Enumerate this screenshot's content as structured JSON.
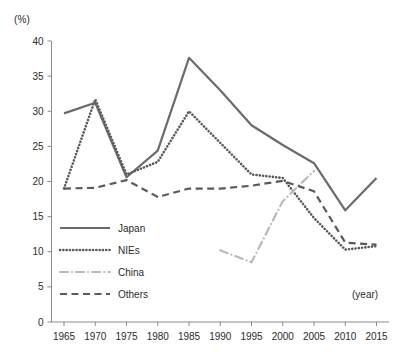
{
  "chart_data": {
    "type": "line",
    "title": "",
    "xlabel": "(year)",
    "ylabel": "(%)",
    "x": [
      1965,
      1970,
      1975,
      1980,
      1985,
      1990,
      1995,
      2000,
      2005,
      2010,
      2015
    ],
    "categories": [
      "1965",
      "1970",
      "1975",
      "1980",
      "1985",
      "1990",
      "1995",
      "2000",
      "2005",
      "2010",
      "2015"
    ],
    "xlim": [
      1963,
      2017
    ],
    "ylim": [
      0,
      40
    ],
    "yticks": [
      0,
      5,
      10,
      15,
      20,
      25,
      30,
      35,
      40
    ],
    "ytick_labels": [
      "0",
      "5",
      "10",
      "15",
      "20",
      "25",
      "30",
      "35",
      "40"
    ],
    "grid": false,
    "legend_position": "lower-left-inside",
    "series": [
      {
        "name": "Japan",
        "style": "solid",
        "color": "#6b6b6b",
        "x": [
          1965,
          1970,
          1975,
          1980,
          1985,
          1990,
          1995,
          2000,
          2005,
          2010,
          2015
        ],
        "values": [
          29.7,
          31.2,
          20.6,
          24.4,
          37.6,
          33.0,
          28.0,
          25.2,
          22.6,
          15.9,
          20.5
        ]
      },
      {
        "name": "NIEs",
        "style": "dotted",
        "color": "#5a5a5a",
        "x": [
          1965,
          1970,
          1975,
          1980,
          1985,
          1990,
          1995,
          2000,
          2005,
          2010,
          2015
        ],
        "values": [
          19.0,
          31.7,
          21.0,
          22.8,
          30.0,
          25.5,
          21.0,
          20.5,
          14.8,
          10.3,
          10.8
        ]
      },
      {
        "name": "China",
        "style": "dashdot",
        "color": "#b9b9b9",
        "x": [
          1990,
          1995,
          2000,
          2005
        ],
        "values": [
          10.2,
          8.5,
          17.2,
          21.5
        ]
      },
      {
        "name": "Others",
        "style": "dashed",
        "color": "#5a5a5a",
        "x": [
          1965,
          1970,
          1975,
          1980,
          1985,
          1990,
          1995,
          2000,
          2005,
          2010,
          2015
        ],
        "values": [
          19.0,
          19.1,
          20.2,
          17.8,
          19.0,
          19.0,
          19.4,
          20.1,
          18.6,
          11.3,
          11.0
        ]
      }
    ]
  },
  "axes": {
    "unit_label": "(%)",
    "x_caption": "(year)"
  },
  "legend": {
    "items": [
      {
        "label": "Japan",
        "style": "solid",
        "color": "#6b6b6b"
      },
      {
        "label": "NIEs",
        "style": "dotted",
        "color": "#5a5a5a"
      },
      {
        "label": "China",
        "style": "dashdot",
        "color": "#b9b9b9"
      },
      {
        "label": "Others",
        "style": "dashed",
        "color": "#5a5a5a"
      }
    ]
  }
}
